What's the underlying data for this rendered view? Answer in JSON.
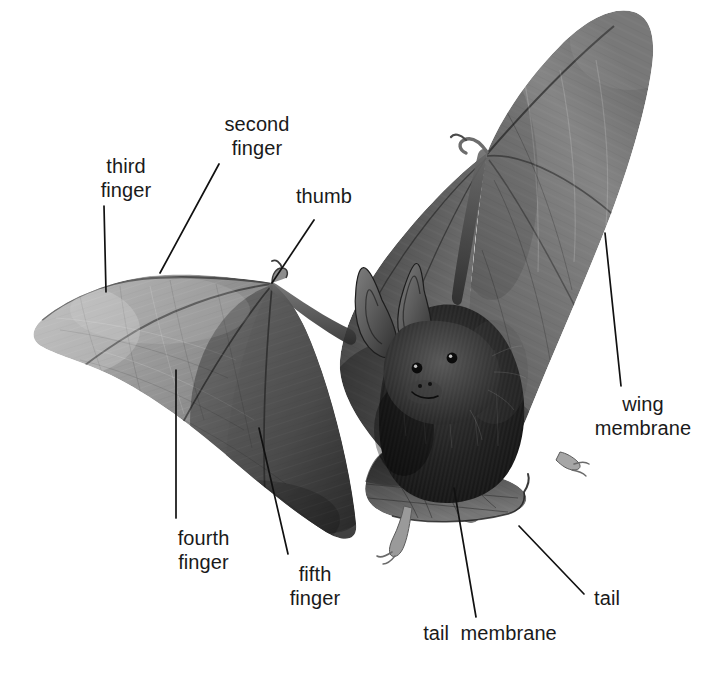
{
  "figure": {
    "background_color": "#ffffff",
    "text_color": "#1a1a1a",
    "leader_line_color": "#111111",
    "width": 705,
    "height": 683
  },
  "labels": [
    {
      "id": "second-finger",
      "text": "second\nfinger",
      "lines": [
        "second",
        "finger"
      ],
      "x": 183,
      "y": 112,
      "width": 148,
      "leader": {
        "x1": 219,
        "y1": 164,
        "x2": 160,
        "y2": 273
      }
    },
    {
      "id": "third-finger",
      "text": "third\nfinger",
      "lines": [
        "third",
        "finger"
      ],
      "x": 62,
      "y": 154,
      "width": 128,
      "leader": {
        "x1": 104,
        "y1": 206,
        "x2": 106,
        "y2": 292
      }
    },
    {
      "id": "thumb",
      "text": "thumb",
      "lines": [
        "thumb"
      ],
      "x": 274,
      "y": 184,
      "width": 100,
      "leader": {
        "x1": 314,
        "y1": 220,
        "x2": 272,
        "y2": 283
      }
    },
    {
      "id": "wing-membrane",
      "text": "wing\nmembrane",
      "lines": [
        "wing",
        "membrane"
      ],
      "x": 583,
      "y": 392,
      "width": 120,
      "leader": {
        "x1": 605,
        "y1": 233,
        "x2": 621,
        "y2": 386
      }
    },
    {
      "id": "fourth-finger",
      "text": "fourth\nfinger",
      "lines": [
        "fourth",
        "finger"
      ],
      "x": 141,
      "y": 526,
      "width": 125,
      "leader": {
        "x1": 176,
        "y1": 370,
        "x2": 176,
        "y2": 518
      }
    },
    {
      "id": "fifth-finger",
      "text": "fifth\nfinger",
      "lines": [
        "fifth",
        "finger"
      ],
      "x": 260,
      "y": 562,
      "width": 110,
      "leader": {
        "x1": 259,
        "y1": 428,
        "x2": 288,
        "y2": 554
      }
    },
    {
      "id": "tail",
      "text": "tail",
      "lines": [
        "tail"
      ],
      "x": 577,
      "y": 586,
      "width": 60,
      "leader": {
        "x1": 519,
        "y1": 526,
        "x2": 584,
        "y2": 594
      }
    },
    {
      "id": "tail-membrane",
      "text": "tail  membrane",
      "lines": [
        "tail  membrane"
      ],
      "x": 405,
      "y": 621,
      "width": 170,
      "leader": {
        "x1": 454,
        "y1": 488,
        "x2": 476,
        "y2": 617
      }
    }
  ],
  "anatomy": {
    "left_wing": {
      "name": "left wing",
      "tone": "#9a9a9a",
      "description": "pale translucent membrane with radiating finger bones"
    },
    "right_wing": {
      "name": "right wing",
      "tone": "#6f6f6f",
      "description": "darker membrane raised above the body"
    },
    "body": {
      "name": "body",
      "tone": "#1e1e1e",
      "description": "dark furry torso"
    },
    "head": {
      "name": "head",
      "tone": "#2a2a2a",
      "description": "furry face with two large upright ears and dark eyes"
    },
    "ears": {
      "name": "ears",
      "count": 2,
      "tone": "#5a5a5a"
    },
    "feet": {
      "name": "feet",
      "count": 2,
      "tone": "#8e8e8e"
    },
    "tail_membrane": {
      "name": "tail membrane",
      "tone": "#4a4a4a"
    }
  }
}
